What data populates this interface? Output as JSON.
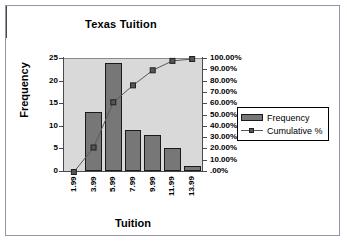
{
  "chart_data": {
    "type": "bar",
    "title": "Texas Tuition",
    "xlabel": "Tuition",
    "ylabel": "Frequency",
    "categories": [
      "1.99",
      "3.99",
      "5.99",
      "7.99",
      "9.99",
      "11.99",
      "13.99"
    ],
    "series": [
      {
        "name": "Frequency",
        "type": "bar",
        "axis": "left",
        "values": [
          0,
          13,
          24,
          9,
          8,
          5,
          1
        ]
      },
      {
        "name": "Cumulative %",
        "type": "line",
        "axis": "right",
        "values": [
          0,
          21.67,
          61.67,
          76.67,
          90.0,
          98.33,
          100.0
        ]
      }
    ],
    "ylim": [
      0,
      25
    ],
    "y2lim": [
      0,
      100
    ],
    "yticks": [
      "0",
      "5",
      "10",
      "15",
      "20",
      "25"
    ],
    "y2ticks": [
      ".00%",
      "10.00%",
      "20.00%",
      "30.00%",
      "40.00%",
      "50.00%",
      "60.00%",
      "70.00%",
      "80.00%",
      "90.00%",
      "100.00%"
    ],
    "grid": false,
    "legend_position": "right",
    "colors": {
      "bar_fill": "#777777",
      "bar_border": "#1a1a1a",
      "line": "#5a5a5a",
      "marker": "#555555",
      "plot_background": "#d9d9d9",
      "frame_border": "#9a92a8",
      "axis": "#4a4a4a"
    }
  },
  "legend": {
    "items": [
      {
        "label": "Frequency"
      },
      {
        "label": "Cumulative %"
      }
    ]
  }
}
